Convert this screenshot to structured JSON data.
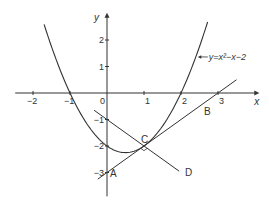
{
  "chart_data": {
    "type": "line",
    "title": "",
    "xlabel": "x",
    "ylabel": "y",
    "xlim": [
      -2.4,
      3.9
    ],
    "ylim": [
      -3.9,
      2.8
    ],
    "x_ticks": [
      -2,
      -1,
      0,
      1,
      2,
      3
    ],
    "x_tick_labels": [
      "−2",
      "−1",
      "0",
      "1",
      "2",
      "3"
    ],
    "y_ticks": [
      2,
      1,
      -1,
      -2,
      -3
    ],
    "y_tick_labels": [
      "2",
      "1",
      "−1",
      "−2",
      "−3"
    ],
    "grid": false,
    "curve": {
      "label": "y=x²−x−2",
      "coefficients": {
        "a": 1,
        "b": -1,
        "c": -2
      },
      "x_range": [
        -1.7,
        2.72
      ]
    },
    "lines": [
      {
        "name": "AB",
        "slope": 1,
        "intercept": -3,
        "x_range": [
          -0.25,
          3.5
        ]
      },
      {
        "name": "CD",
        "slope": -1,
        "intercept": -1,
        "x_range": [
          -0.35,
          1.95
        ]
      }
    ],
    "points": [
      {
        "label": "A",
        "x": 0,
        "y": -3
      },
      {
        "label": "B",
        "x": 2.7,
        "y": -0.3
      },
      {
        "label": "C",
        "x": 1,
        "y": -2
      },
      {
        "label": "D",
        "x": 2,
        "y": -3
      }
    ]
  }
}
